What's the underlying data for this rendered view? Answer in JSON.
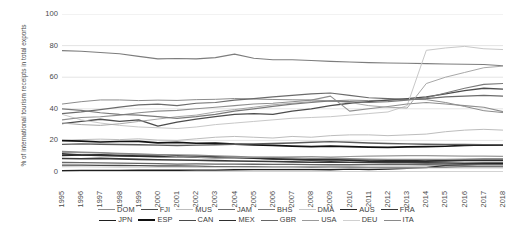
{
  "chart_data": {
    "type": "line",
    "title": "",
    "xlabel": "",
    "ylabel": "% of international tourism receipts in total exports",
    "ylim": [
      0,
      100
    ],
    "yticks": [
      0,
      20,
      40,
      60,
      80,
      100
    ],
    "grid": true,
    "legend_position": "bottom",
    "x": [
      1995,
      1996,
      1997,
      1998,
      1999,
      2000,
      2001,
      2002,
      2003,
      2004,
      2005,
      2006,
      2007,
      2008,
      2009,
      2010,
      2011,
      2012,
      2013,
      2014,
      2015,
      2016,
      2017,
      2018
    ],
    "categories": [
      "1995",
      "1996",
      "1997",
      "1998",
      "1999",
      "2000",
      "2001",
      "2002",
      "2003",
      "2004",
      "2005",
      "2006",
      "2007",
      "2008",
      "2009",
      "2010",
      "2011",
      "2012",
      "2013",
      "2014",
      "2015",
      "2016",
      "2017",
      "2018"
    ],
    "series": [
      {
        "name": "DOM",
        "color": "#8c8c8c",
        "width": 1.0,
        "values": [
          43.0,
          44.5,
          45.6,
          45.6,
          45.2,
          45.5,
          45.3,
          45.8,
          46.0,
          46.5,
          46.2,
          45.9,
          45.7,
          45.6,
          45.0,
          45.5,
          45.2,
          45.5,
          46.0,
          45.8,
          44.0,
          41.5,
          38.8,
          37.6
        ]
      },
      {
        "name": "FJI",
        "color": "#4d4d4d",
        "width": 1.3,
        "values": [
          30.6,
          32.0,
          33.4,
          32.0,
          33.0,
          29.0,
          31.5,
          33.5,
          35.0,
          36.5,
          37.0,
          36.5,
          38.5,
          40.0,
          42.0,
          43.5,
          44.5,
          45.5,
          46.5,
          47.5,
          49.5,
          51.5,
          53.0,
          52.5
        ]
      },
      {
        "name": "MUS",
        "color": "#bdbdbd",
        "width": 1.0,
        "values": [
          20.0,
          20.5,
          20.8,
          20.5,
          21.0,
          20.2,
          20.0,
          21.0,
          22.0,
          22.5,
          22.0,
          21.5,
          22.5,
          22.0,
          23.0,
          23.5,
          23.5,
          23.0,
          23.5,
          24.0,
          25.5,
          26.5,
          27.0,
          26.5
        ]
      },
      {
        "name": "JAM",
        "color": "#6b6b6b",
        "width": 1.2,
        "values": [
          37.0,
          38.0,
          39.5,
          41.0,
          42.5,
          43.0,
          42.0,
          43.5,
          44.0,
          45.5,
          46.5,
          47.5,
          48.5,
          49.5,
          50.0,
          48.5,
          47.0,
          46.5,
          46.0,
          46.5,
          47.5,
          48.0,
          48.5,
          48.0
        ]
      },
      {
        "name": "BHS",
        "color": "#7d7d7d",
        "width": 1.1,
        "values": [
          76.8,
          76.4,
          75.6,
          74.8,
          73.2,
          71.6,
          71.8,
          71.6,
          72.4,
          74.6,
          72.0,
          71.0,
          71.0,
          70.6,
          70.0,
          69.6,
          69.2,
          69.0,
          68.8,
          68.6,
          68.4,
          68.2,
          68.0,
          67.2
        ]
      },
      {
        "name": "DMA",
        "color": "#c8c8c8",
        "width": 1.0,
        "values": [
          36.5,
          33.0,
          31.0,
          29.5,
          28.5,
          28.0,
          27.5,
          28.5,
          30.0,
          31.0,
          32.0,
          33.0,
          34.0,
          34.5,
          35.0,
          36.0,
          37.0,
          38.0,
          42.0,
          77.0,
          78.5,
          79.5,
          78.0,
          77.5
        ]
      },
      {
        "name": "AUS",
        "color": "#2b2b2b",
        "width": 1.6,
        "values": [
          10.5,
          10.8,
          10.9,
          10.6,
          10.4,
          10.8,
          10.3,
          10.0,
          9.6,
          9.3,
          8.8,
          8.2,
          8.0,
          7.6,
          7.8,
          7.4,
          6.8,
          6.6,
          6.5,
          6.8,
          7.4,
          7.8,
          8.0,
          8.0
        ]
      },
      {
        "name": "FRA",
        "color": "#3a3a3a",
        "width": 1.6,
        "values": [
          8.5,
          8.4,
          8.6,
          8.3,
          8.0,
          7.8,
          7.6,
          7.4,
          7.2,
          7.0,
          6.8,
          6.6,
          6.4,
          6.2,
          6.4,
          6.2,
          6.0,
          5.9,
          5.9,
          5.8,
          5.7,
          5.5,
          5.6,
          5.6
        ]
      },
      {
        "name": "JPN",
        "color": "#1f1f1f",
        "width": 1.4,
        "values": [
          0.9,
          1.0,
          1.0,
          1.0,
          1.1,
          1.1,
          1.1,
          1.2,
          1.2,
          1.4,
          1.5,
          1.5,
          1.5,
          1.5,
          1.4,
          1.8,
          1.6,
          1.9,
          2.3,
          2.8,
          4.2,
          4.6,
          5.0,
          5.3
        ]
      },
      {
        "name": "ESP",
        "color": "#111111",
        "width": 1.7,
        "values": [
          19.8,
          19.6,
          19.0,
          19.3,
          19.4,
          18.4,
          18.8,
          18.2,
          18.3,
          17.6,
          17.2,
          16.8,
          16.4,
          16.0,
          16.4,
          16.0,
          15.8,
          15.6,
          15.9,
          16.0,
          16.3,
          16.8,
          17.1,
          17.0
        ]
      },
      {
        "name": "CAN",
        "color": "#4a4a4a",
        "width": 1.3,
        "values": [
          4.4,
          4.3,
          4.2,
          4.1,
          4.0,
          3.8,
          3.8,
          3.7,
          3.4,
          3.3,
          3.2,
          3.1,
          3.1,
          3.0,
          3.0,
          3.0,
          2.9,
          2.9,
          2.9,
          2.9,
          3.0,
          3.2,
          3.3,
          3.3
        ]
      },
      {
        "name": "MEX",
        "color": "#2e2e2e",
        "width": 1.5,
        "values": [
          11.6,
          10.8,
          10.5,
          10.2,
          10.0,
          9.6,
          9.8,
          9.4,
          9.2,
          9.0,
          8.8,
          8.4,
          8.0,
          7.8,
          8.2,
          7.8,
          7.6,
          7.4,
          7.2,
          7.0,
          7.0,
          7.2,
          7.4,
          7.3
        ]
      },
      {
        "name": "GBR",
        "color": "#666666",
        "width": 1.3,
        "values": [
          6.0,
          5.9,
          5.8,
          5.6,
          5.5,
          5.3,
          5.0,
          5.1,
          5.0,
          5.0,
          4.9,
          4.8,
          4.8,
          4.7,
          4.6,
          4.6,
          4.7,
          4.7,
          4.7,
          4.6,
          4.5,
          4.5,
          4.6,
          4.6
        ]
      },
      {
        "name": "USA",
        "color": "#9a9a9a",
        "width": 1.2,
        "values": [
          12.4,
          12.2,
          12.1,
          11.4,
          11.0,
          10.8,
          9.8,
          9.4,
          8.8,
          9.0,
          9.2,
          9.4,
          9.6,
          9.8,
          9.4,
          9.8,
          10.0,
          10.2,
          10.4,
          10.4,
          10.2,
          10.0,
          10.0,
          9.9
        ]
      },
      {
        "name": "DEU",
        "color": "#d0d0d0",
        "width": 1.1,
        "values": [
          3.4,
          3.3,
          3.2,
          3.1,
          3.1,
          3.0,
          3.0,
          2.9,
          2.9,
          2.8,
          2.7,
          2.7,
          2.6,
          2.5,
          2.6,
          2.5,
          2.5,
          2.5,
          2.5,
          2.5,
          2.5,
          2.6,
          2.6,
          2.6
        ]
      },
      {
        "name": "ITA",
        "color": "#8a8a8a",
        "width": 1.3,
        "values": [
          13.0,
          12.6,
          12.2,
          11.8,
          11.4,
          11.0,
          10.8,
          10.6,
          10.2,
          9.8,
          9.4,
          9.2,
          9.0,
          8.6,
          8.8,
          8.4,
          8.2,
          8.0,
          8.0,
          8.0,
          8.0,
          8.1,
          8.2,
          8.2
        ]
      },
      {
        "name": "series-spike-a",
        "color": "#8f8f8f",
        "width": 1.1,
        "values": [
          33.0,
          34.5,
          35.0,
          36.0,
          37.5,
          38.5,
          39.0,
          40.0,
          41.0,
          42.0,
          43.0,
          43.5,
          44.5,
          45.5,
          48.0,
          38.5,
          40.0,
          41.5,
          43.0,
          44.0,
          43.0,
          42.0,
          41.0,
          38.2
        ]
      },
      {
        "name": "series-spike-b",
        "color": "#a8a8a8",
        "width": 1.0,
        "values": [
          31.0,
          30.0,
          29.5,
          30.5,
          32.0,
          33.5,
          35.0,
          36.0,
          38.0,
          39.5,
          41.0,
          42.5,
          43.5,
          44.5,
          45.0,
          44.0,
          42.0,
          41.0,
          40.5,
          56.0,
          60.0,
          63.0,
          66.0,
          67.0
        ]
      },
      {
        "name": "series-mid-c",
        "color": "#5c5c5c",
        "width": 1.4,
        "values": [
          17.5,
          17.8,
          17.6,
          17.4,
          17.2,
          17.0,
          16.8,
          17.0,
          17.2,
          17.6,
          17.8,
          18.0,
          18.4,
          18.8,
          19.2,
          18.8,
          18.4,
          18.0,
          17.8,
          17.6,
          17.5,
          17.4,
          17.3,
          17.2
        ]
      },
      {
        "name": "series-mid-d",
        "color": "#7a7a7a",
        "width": 1.2,
        "values": [
          40.0,
          39.0,
          37.5,
          36.5,
          36.0,
          35.0,
          34.0,
          35.0,
          36.5,
          38.5,
          40.0,
          41.5,
          43.0,
          44.0,
          45.0,
          44.5,
          44.0,
          44.5,
          45.5,
          47.0,
          50.0,
          53.0,
          55.5,
          56.0
        ]
      }
    ]
  },
  "legend": {
    "rows": [
      [
        {
          "label": "DOM",
          "color": "#8c8c8c",
          "width": 1.0
        },
        {
          "label": "FJI",
          "color": "#4d4d4d",
          "width": 1.6
        },
        {
          "label": "MUS",
          "color": "#bdbdbd",
          "width": 1.2
        },
        {
          "label": "JAM",
          "color": "#6b6b6b",
          "width": 1.5
        },
        {
          "label": "BHS",
          "color": "#7d7d7d",
          "width": 1.3
        },
        {
          "label": "DMA",
          "color": "#c8c8c8",
          "width": 1.2
        },
        {
          "label": "AUS",
          "color": "#2b2b2b",
          "width": 1.9
        },
        {
          "label": "FRA",
          "color": "#3a3a3a",
          "width": 1.9
        }
      ],
      [
        {
          "label": "JPN",
          "color": "#1f1f1f",
          "width": 1.8
        },
        {
          "label": "ESP",
          "color": "#111111",
          "width": 2.0
        },
        {
          "label": "CAN",
          "color": "#4a4a4a",
          "width": 1.6
        },
        {
          "label": "MEX",
          "color": "#2e2e2e",
          "width": 1.8
        },
        {
          "label": "GBR",
          "color": "#666666",
          "width": 1.5
        },
        {
          "label": "USA",
          "color": "#9a9a9a",
          "width": 1.4
        },
        {
          "label": "DEU",
          "color": "#d0d0d0",
          "width": 1.2
        },
        {
          "label": "ITA",
          "color": "#8a8a8a",
          "width": 1.5
        }
      ]
    ]
  },
  "axis_style": {
    "gridline_color": "#d9d9d9",
    "axis_color": "#9c9c9c",
    "tick_text_color": "#4a4a4a"
  }
}
